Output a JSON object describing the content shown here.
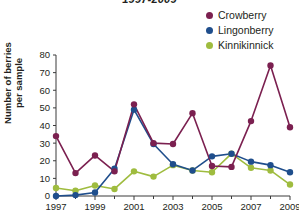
{
  "chart_data": {
    "type": "line",
    "title": "1997-2009",
    "xlabel": "",
    "ylabel": "Number of berries per sample",
    "ylabel_lines": [
      "Number of berries",
      "per sample"
    ],
    "x": [
      1997,
      1998,
      1999,
      2000,
      2001,
      2002,
      2003,
      2004,
      2005,
      2006,
      2007,
      2008,
      2009
    ],
    "x_tick_labels": [
      "1997",
      "",
      "1999",
      "",
      "2001",
      "",
      "2003",
      "",
      "2005",
      "",
      "2007",
      "",
      "2009"
    ],
    "y_tick_labels": [
      "0",
      "10",
      "20",
      "30",
      "40",
      "50",
      "60",
      "70",
      "80"
    ],
    "y_ticks": [
      0,
      10,
      20,
      30,
      40,
      50,
      60,
      70,
      80
    ],
    "xlim": [
      1997,
      2009
    ],
    "ylim": [
      0,
      80
    ],
    "grid": false,
    "legend_position": "top-right",
    "series": [
      {
        "name": "Crowberry",
        "color": "#7B2050",
        "values": [
          34,
          13,
          23,
          14,
          52,
          30,
          29.5,
          47,
          17,
          16.5,
          42.5,
          74,
          39
        ]
      },
      {
        "name": "Lingonberry",
        "color": "#1F4E8C",
        "values": [
          0,
          0.5,
          2,
          15.5,
          49,
          29.5,
          18,
          14.5,
          22.5,
          24,
          19.5,
          17.5,
          13.5
        ]
      },
      {
        "name": "Kinnikinnick",
        "color": "#9FBC3F",
        "values": [
          4.5,
          3,
          6,
          4,
          14,
          11,
          17.5,
          14.5,
          13.5,
          24,
          16,
          14.5,
          6.5
        ]
      }
    ]
  },
  "legend": {
    "items": [
      {
        "label": "Crowberry",
        "color": "#7B2050"
      },
      {
        "label": "Lingonberry",
        "color": "#1F4E8C"
      },
      {
        "label": "Kinnikinnick",
        "color": "#9FBC3F"
      }
    ]
  }
}
